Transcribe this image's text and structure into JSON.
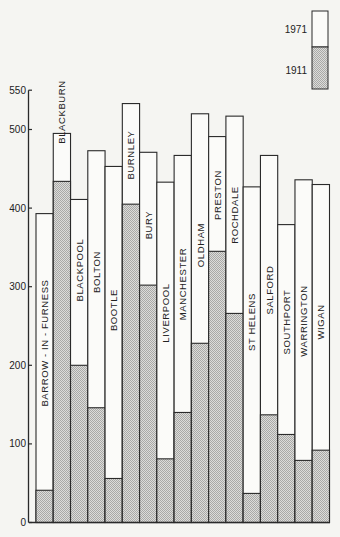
{
  "chart_data": {
    "type": "bar",
    "subtype": "overlapping-bars",
    "title": "",
    "xlabel": "",
    "ylabel": "",
    "ylim": [
      0,
      550
    ],
    "yticks": [
      0,
      100,
      200,
      300,
      400,
      500,
      550
    ],
    "grid": false,
    "legend": {
      "position": "top-right",
      "entries": [
        {
          "label": "1971",
          "style": "white"
        },
        {
          "label": "1911",
          "style": "stippled-gray"
        }
      ]
    },
    "categories": [
      "BARROW - IN - FURNESS",
      "BLACKBURN",
      "BLACKPOOL",
      "BOLTON",
      "BOOTLE",
      "BURNLEY",
      "BURY",
      "LIVERPOOL",
      "MANCHESTER",
      "OLDHAM",
      "PRESTON",
      "ROCHDALE",
      "ST HELENS",
      "SALFORD",
      "SOUTHPORT",
      "WARRINGTON",
      "WIGAN"
    ],
    "series": [
      {
        "name": "1971",
        "values": [
          393,
          495,
          411,
          473,
          453,
          533,
          471,
          433,
          467,
          520,
          491,
          517,
          427,
          467,
          379,
          436,
          430
        ]
      },
      {
        "name": "1911",
        "values": [
          41,
          434,
          200,
          146,
          56,
          405,
          302,
          81,
          140,
          228,
          345,
          266,
          37,
          137,
          112,
          79,
          92
        ]
      }
    ],
    "label_positions": [
      {
        "cy": 343
      },
      {
        "cy": 112
      },
      {
        "cy": 270
      },
      {
        "cy": 272
      },
      {
        "cy": 310
      },
      {
        "cy": 155
      },
      {
        "cy": 225
      },
      {
        "cy": 313
      },
      {
        "cy": 284
      },
      {
        "cy": 245
      },
      {
        "cy": 195
      },
      {
        "cy": 215
      },
      {
        "cy": 322
      },
      {
        "cy": 290
      },
      {
        "cy": 322
      },
      {
        "cy": 321
      },
      {
        "cy": 322
      }
    ]
  },
  "colors": {
    "background": "#f5f5f2",
    "line": "#2a2a2a",
    "bar_1971": "#fbfbf9",
    "stipple_light": "#e0e0de",
    "stipple_dark": "#a8a8a6"
  }
}
